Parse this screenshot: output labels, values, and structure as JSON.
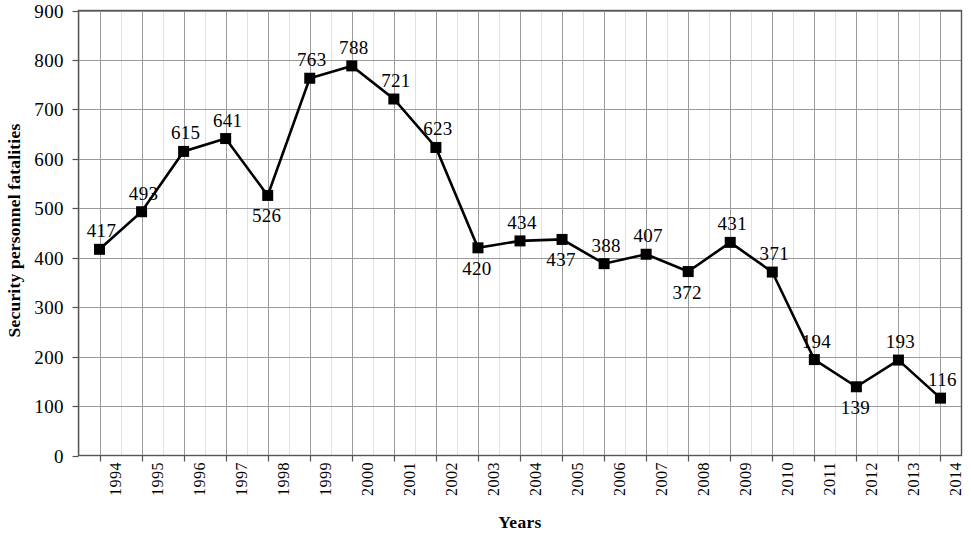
{
  "chart_data": {
    "type": "line",
    "title": "",
    "xlabel": "Years",
    "ylabel": "Security personnel fatalities",
    "categories": [
      "1994",
      "1995",
      "1996",
      "1997",
      "1998",
      "1999",
      "2000",
      "2001",
      "2002",
      "2003",
      "2004",
      "2005",
      "2006",
      "2007",
      "2008",
      "2009",
      "2010",
      "2011",
      "2012",
      "2013",
      "2014"
    ],
    "values": [
      417,
      493,
      615,
      641,
      526,
      763,
      788,
      721,
      623,
      420,
      434,
      437,
      388,
      407,
      372,
      431,
      371,
      194,
      139,
      193,
      116
    ],
    "label_positions": [
      "above",
      "above",
      "above",
      "above",
      "below",
      "above",
      "above",
      "above",
      "above",
      "below",
      "above",
      "below",
      "above",
      "above",
      "below",
      "above",
      "above",
      "above",
      "below",
      "above",
      "above"
    ],
    "ylim": [
      0,
      900
    ],
    "y_ticks": [
      0,
      100,
      200,
      300,
      400,
      500,
      600,
      700,
      800,
      900
    ],
    "y_tick_labels": [
      "0",
      "100",
      "200",
      "300",
      "400",
      "500",
      "600",
      "700",
      "800",
      "900"
    ],
    "grid": {
      "horizontal_major": true,
      "vertical_major": true,
      "vertical_minor": true,
      "color": "#9a9a9a",
      "minor_color": "#c0c0c0"
    },
    "legend": null,
    "marker": {
      "shape": "square",
      "size": 11,
      "color": "#000000"
    },
    "line": {
      "color": "#000000",
      "width": 2.6
    }
  },
  "axes": {
    "x_title": "Years",
    "y_title": "Security personnel fatalities"
  },
  "colors": {
    "background": "#ffffff",
    "foreground": "#000000",
    "grid": "#9a9a9a",
    "grid_minor": "#c3c3c3",
    "frame": "#555555"
  }
}
